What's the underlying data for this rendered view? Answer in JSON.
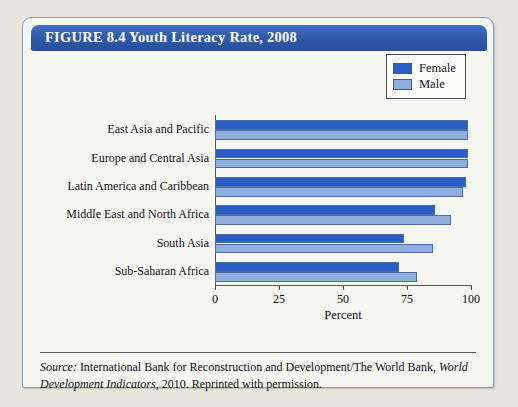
{
  "figure": {
    "title": "FIGURE 8.4  Youth Literacy Rate, 2008",
    "frame_border_color": "#7d9bc9",
    "title_bar_color": "#2d58a8"
  },
  "legend": {
    "position": "top-right",
    "items": [
      {
        "label": "Female",
        "color": "#2b5ec4"
      },
      {
        "label": "Male",
        "color": "#8faedc"
      }
    ]
  },
  "source": {
    "prefix": "Source:",
    "text_part1": " International Bank for Reconstruction and Development/The World Bank, ",
    "italic_title": "World Development Indicators",
    "text_part2": ", 2010. Reprinted with permission."
  },
  "chart_data": {
    "type": "bar",
    "orientation": "horizontal",
    "title": "Youth Literacy Rate, 2008",
    "xlabel": "Percent",
    "ylabel": "",
    "xlim": [
      0,
      100
    ],
    "xticks": [
      0,
      25,
      50,
      75,
      100
    ],
    "xticklabels": [
      "0",
      "25",
      "50",
      "75",
      "100"
    ],
    "grid": false,
    "legend_position": "top-right",
    "categories": [
      "East Asia and Pacific",
      "Europe and Central Asia",
      "Latin America and Caribbean",
      "Middle East and North Africa",
      "South Asia",
      "Sub-Saharan Africa"
    ],
    "series": [
      {
        "name": "Female",
        "color": "#2b5ec4",
        "values": [
          99,
          99,
          98,
          86,
          74,
          72
        ]
      },
      {
        "name": "Male",
        "color": "#8faedc",
        "values": [
          99,
          99,
          97,
          92,
          85,
          79
        ]
      }
    ]
  }
}
